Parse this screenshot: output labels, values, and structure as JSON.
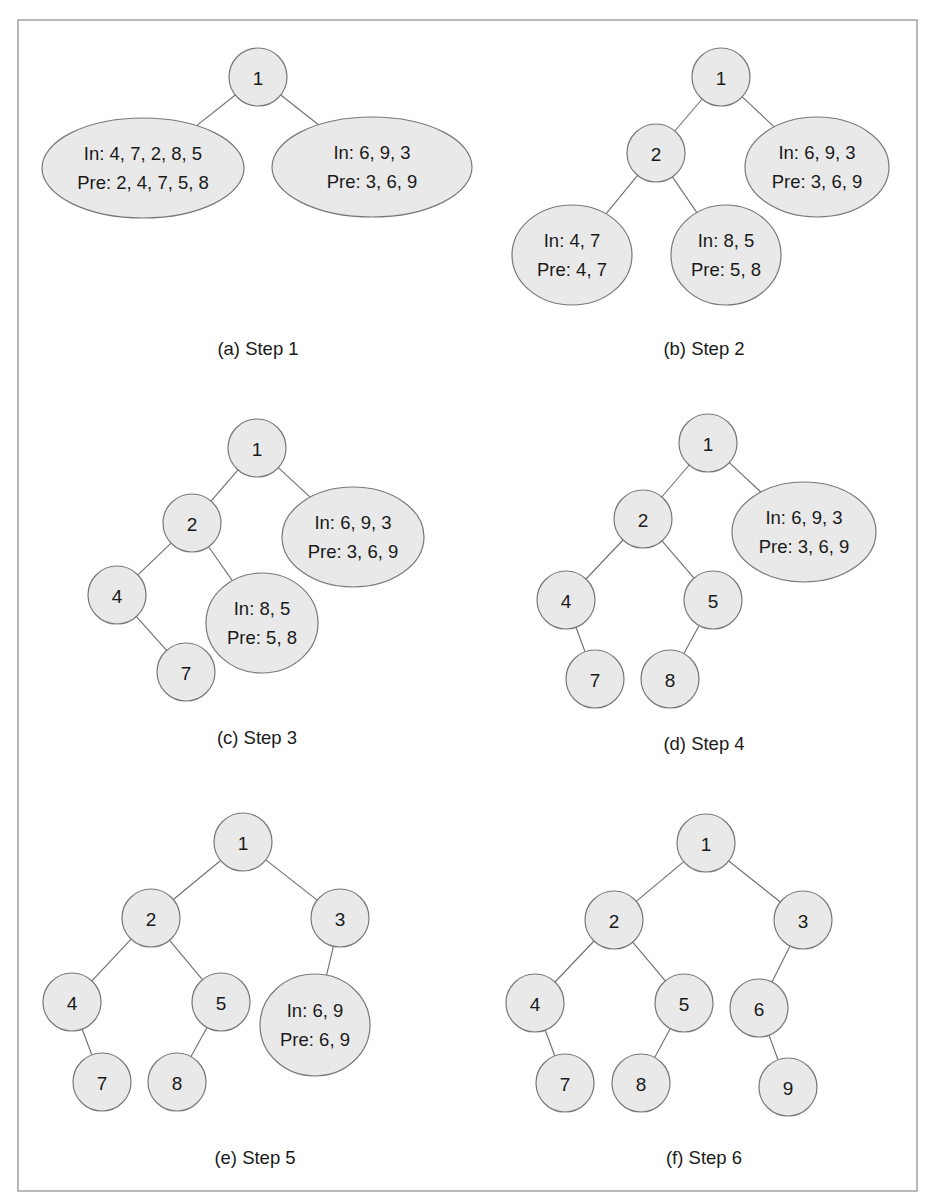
{
  "figure": {
    "colors": {
      "node_fill": "#e9e9e9",
      "node_stroke": "#787878",
      "edge": "#6e6e6e",
      "frame": "#8a8a8a",
      "text": "#1a1a1a"
    },
    "frame": {
      "x": 18,
      "y": 20,
      "width": 899,
      "height": 1171
    },
    "panels": [
      {
        "id": "a",
        "caption": "(a) Step 1",
        "caption_pos": [
          258,
          348
        ],
        "nodes": [
          {
            "id": "n1",
            "type": "circle",
            "label": "1",
            "cx": 258,
            "cy": 77,
            "r": 29
          },
          {
            "id": "left",
            "type": "ellipse",
            "lines": [
              "In: 4, 7, 2, 8, 5",
              "Pre: 2, 4, 7, 5, 8"
            ],
            "cx": 143,
            "cy": 168,
            "rx": 101,
            "ry": 50
          },
          {
            "id": "right",
            "type": "ellipse",
            "lines": [
              "In: 6, 9, 3",
              "Pre: 3, 6, 9"
            ],
            "cx": 372,
            "cy": 167,
            "rx": 100,
            "ry": 50
          }
        ],
        "edges": [
          [
            "n1",
            "left"
          ],
          [
            "n1",
            "right"
          ]
        ]
      },
      {
        "id": "b",
        "caption": "(b) Step 2",
        "caption_pos": [
          704,
          348
        ],
        "nodes": [
          {
            "id": "n1",
            "type": "circle",
            "label": "1",
            "cx": 721,
            "cy": 77,
            "r": 29
          },
          {
            "id": "n2",
            "type": "circle",
            "label": "2",
            "cx": 656,
            "cy": 153,
            "r": 29
          },
          {
            "id": "right",
            "type": "ellipse",
            "lines": [
              "In: 6, 9, 3",
              "Pre: 3, 6, 9"
            ],
            "cx": 817,
            "cy": 167,
            "rx": 72,
            "ry": 50
          },
          {
            "id": "ll",
            "type": "ellipse",
            "lines": [
              "In: 4, 7",
              "Pre: 4, 7"
            ],
            "cx": 572,
            "cy": 255,
            "rx": 60,
            "ry": 50
          },
          {
            "id": "lr",
            "type": "ellipse",
            "lines": [
              "In: 8, 5",
              "Pre: 5, 8"
            ],
            "cx": 726,
            "cy": 255,
            "rx": 55,
            "ry": 50
          }
        ],
        "edges": [
          [
            "n1",
            "n2"
          ],
          [
            "n1",
            "right"
          ],
          [
            "n2",
            "ll"
          ],
          [
            "n2",
            "lr"
          ]
        ]
      },
      {
        "id": "c",
        "caption": "(c) Step 3",
        "caption_pos": [
          257,
          737
        ],
        "nodes": [
          {
            "id": "n1",
            "type": "circle",
            "label": "1",
            "cx": 257,
            "cy": 448,
            "r": 29
          },
          {
            "id": "n2",
            "type": "circle",
            "label": "2",
            "cx": 192,
            "cy": 523,
            "r": 29
          },
          {
            "id": "right",
            "type": "ellipse",
            "lines": [
              "In: 6, 9, 3",
              "Pre: 3, 6, 9"
            ],
            "cx": 353,
            "cy": 537,
            "rx": 71,
            "ry": 50
          },
          {
            "id": "n4",
            "type": "circle",
            "label": "4",
            "cx": 117,
            "cy": 595,
            "r": 29
          },
          {
            "id": "lr",
            "type": "ellipse",
            "lines": [
              "In: 8, 5",
              "Pre: 5, 8"
            ],
            "cx": 262,
            "cy": 623,
            "rx": 56,
            "ry": 50
          },
          {
            "id": "n7",
            "type": "circle",
            "label": "7",
            "cx": 186,
            "cy": 672,
            "r": 29
          }
        ],
        "edges": [
          [
            "n1",
            "n2"
          ],
          [
            "n1",
            "right"
          ],
          [
            "n2",
            "n4"
          ],
          [
            "n2",
            "lr"
          ],
          [
            "n4",
            "n7"
          ]
        ]
      },
      {
        "id": "d",
        "caption": "(d) Step 4",
        "caption_pos": [
          704,
          743
        ],
        "nodes": [
          {
            "id": "n1",
            "type": "circle",
            "label": "1",
            "cx": 708,
            "cy": 443,
            "r": 29
          },
          {
            "id": "n2",
            "type": "circle",
            "label": "2",
            "cx": 643,
            "cy": 519,
            "r": 29
          },
          {
            "id": "right",
            "type": "ellipse",
            "lines": [
              "In: 6, 9, 3",
              "Pre: 3, 6, 9"
            ],
            "cx": 804,
            "cy": 532,
            "rx": 72,
            "ry": 50
          },
          {
            "id": "n4",
            "type": "circle",
            "label": "4",
            "cx": 566,
            "cy": 600,
            "r": 29
          },
          {
            "id": "n5",
            "type": "circle",
            "label": "5",
            "cx": 713,
            "cy": 600,
            "r": 29
          },
          {
            "id": "n7",
            "type": "circle",
            "label": "7",
            "cx": 595,
            "cy": 679,
            "r": 29
          },
          {
            "id": "n8",
            "type": "circle",
            "label": "8",
            "cx": 670,
            "cy": 679,
            "r": 29
          }
        ],
        "edges": [
          [
            "n1",
            "n2"
          ],
          [
            "n1",
            "right"
          ],
          [
            "n2",
            "n4"
          ],
          [
            "n2",
            "n5"
          ],
          [
            "n4",
            "n7"
          ],
          [
            "n5",
            "n8"
          ]
        ]
      },
      {
        "id": "e",
        "caption": "(e) Step 5",
        "caption_pos": [
          255,
          1157
        ],
        "nodes": [
          {
            "id": "n1",
            "type": "circle",
            "label": "1",
            "cx": 243,
            "cy": 842,
            "r": 29
          },
          {
            "id": "n2",
            "type": "circle",
            "label": "2",
            "cx": 151,
            "cy": 918,
            "r": 29
          },
          {
            "id": "n3",
            "type": "circle",
            "label": "3",
            "cx": 340,
            "cy": 918,
            "r": 29
          },
          {
            "id": "n4",
            "type": "circle",
            "label": "4",
            "cx": 72,
            "cy": 1002,
            "r": 29
          },
          {
            "id": "n5",
            "type": "circle",
            "label": "5",
            "cx": 221,
            "cy": 1002,
            "r": 29
          },
          {
            "id": "rl",
            "type": "ellipse",
            "lines": [
              "In: 6, 9",
              "Pre: 6, 9"
            ],
            "cx": 315,
            "cy": 1025,
            "rx": 55,
            "ry": 51
          },
          {
            "id": "n7",
            "type": "circle",
            "label": "7",
            "cx": 102,
            "cy": 1082,
            "r": 29
          },
          {
            "id": "n8",
            "type": "circle",
            "label": "8",
            "cx": 177,
            "cy": 1082,
            "r": 29
          }
        ],
        "edges": [
          [
            "n1",
            "n2"
          ],
          [
            "n1",
            "n3"
          ],
          [
            "n2",
            "n4"
          ],
          [
            "n2",
            "n5"
          ],
          [
            "n3",
            "rl"
          ],
          [
            "n4",
            "n7"
          ],
          [
            "n5",
            "n8"
          ]
        ]
      },
      {
        "id": "f",
        "caption": "(f) Step 6",
        "caption_pos": [
          704,
          1157
        ],
        "nodes": [
          {
            "id": "n1",
            "type": "circle",
            "label": "1",
            "cx": 706,
            "cy": 843,
            "r": 29
          },
          {
            "id": "n2",
            "type": "circle",
            "label": "2",
            "cx": 614,
            "cy": 920,
            "r": 29
          },
          {
            "id": "n3",
            "type": "circle",
            "label": "3",
            "cx": 803,
            "cy": 920,
            "r": 29
          },
          {
            "id": "n4",
            "type": "circle",
            "label": "4",
            "cx": 535,
            "cy": 1003,
            "r": 29
          },
          {
            "id": "n5",
            "type": "circle",
            "label": "5",
            "cx": 684,
            "cy": 1003,
            "r": 29
          },
          {
            "id": "n6",
            "type": "circle",
            "label": "6",
            "cx": 759,
            "cy": 1008,
            "r": 29
          },
          {
            "id": "n7",
            "type": "circle",
            "label": "7",
            "cx": 565,
            "cy": 1083,
            "r": 29
          },
          {
            "id": "n8",
            "type": "circle",
            "label": "8",
            "cx": 641,
            "cy": 1083,
            "r": 29
          },
          {
            "id": "n9",
            "type": "circle",
            "label": "9",
            "cx": 788,
            "cy": 1087,
            "r": 29
          }
        ],
        "edges": [
          [
            "n1",
            "n2"
          ],
          [
            "n1",
            "n3"
          ],
          [
            "n2",
            "n4"
          ],
          [
            "n2",
            "n5"
          ],
          [
            "n3",
            "n6"
          ],
          [
            "n4",
            "n7"
          ],
          [
            "n5",
            "n8"
          ],
          [
            "n6",
            "n9"
          ]
        ]
      }
    ]
  }
}
